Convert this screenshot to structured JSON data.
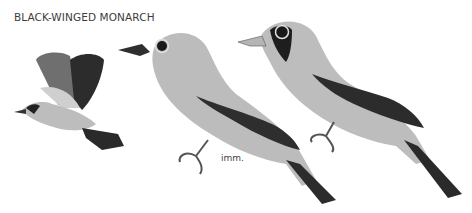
{
  "plate": {
    "title": "BLACK-WINGED MONARCH",
    "figures": [
      {
        "id": "flying",
        "description": "adult in flight"
      },
      {
        "id": "immature",
        "description": "immature perched",
        "label": "imm."
      },
      {
        "id": "adult",
        "description": "adult perched, black face"
      }
    ],
    "colors": {
      "background": "#ffffff",
      "body": "#b9b9b9",
      "wing_dark": "#2e2e2e",
      "face_mask": "#1f1f1f",
      "text": "#3c3c3c"
    }
  }
}
